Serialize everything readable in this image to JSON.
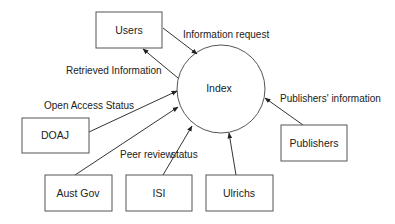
{
  "diagram": {
    "center": {
      "label": "Index",
      "cx": 221,
      "cy": 89,
      "r": 44
    },
    "nodes": [
      {
        "id": "users",
        "label": "Users",
        "x": 96,
        "y": 12,
        "w": 66,
        "h": 36
      },
      {
        "id": "doaj",
        "label": "DOAJ",
        "x": 22,
        "y": 118,
        "w": 67,
        "h": 35
      },
      {
        "id": "austgov",
        "label": "Aust Gov",
        "x": 45,
        "y": 175,
        "w": 67,
        "h": 36
      },
      {
        "id": "isi",
        "label": "ISI",
        "x": 126,
        "y": 175,
        "w": 66,
        "h": 36
      },
      {
        "id": "ulrichs",
        "label": "Ulrichs",
        "x": 206,
        "y": 175,
        "w": 67,
        "h": 36
      },
      {
        "id": "publishers",
        "label": "Publishers",
        "x": 281,
        "y": 125,
        "w": 66,
        "h": 36
      }
    ],
    "edges": [
      {
        "from": "users",
        "to": "index",
        "label": "Information request"
      },
      {
        "from": "index",
        "to": "users",
        "label": "Retrieved Information"
      },
      {
        "from": "doaj",
        "to": "index",
        "label": "Open Access Status"
      },
      {
        "from": "austgov",
        "to": "index",
        "label": ""
      },
      {
        "from": "isi",
        "to": "index",
        "label": "Peer review"
      },
      {
        "from": "ulrichs",
        "to": "index",
        "label": "status"
      },
      {
        "from": "publishers",
        "to": "index",
        "label": "Publishers' information"
      }
    ],
    "colors": {
      "stroke": "#333333",
      "box_border": "#555555",
      "text": "#222222",
      "background": "#ffffff"
    }
  }
}
